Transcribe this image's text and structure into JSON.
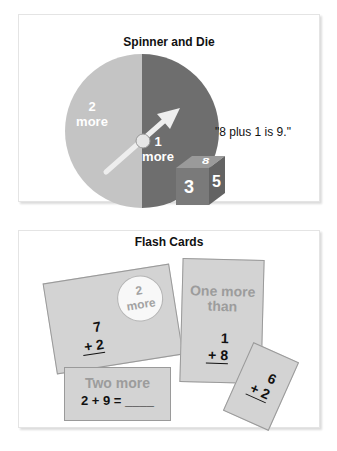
{
  "spinner_panel": {
    "title": "Spinner and Die",
    "spinner": {
      "left_section": {
        "number": "2",
        "label": "more",
        "color": "#c4c4c4"
      },
      "right_section": {
        "number": "1",
        "label": "more",
        "color": "#6e6e6e"
      }
    },
    "die": {
      "top": "8",
      "front": "3",
      "side": "5",
      "color": "#787878"
    },
    "quote": "\"8 plus 1 is 9.\""
  },
  "flash_panel": {
    "title": "Flash Cards",
    "cards": [
      {
        "circle_number": "2",
        "circle_label": "more",
        "top": "7",
        "bottom": "+ 2"
      },
      {
        "heading": "Two more",
        "equation": "2 + 9 = ____"
      },
      {
        "heading_line1": "One more",
        "heading_line2": "than",
        "top": "1",
        "bottom": "+ 8"
      },
      {
        "top": "6",
        "bottom": "+ 2"
      }
    ]
  }
}
